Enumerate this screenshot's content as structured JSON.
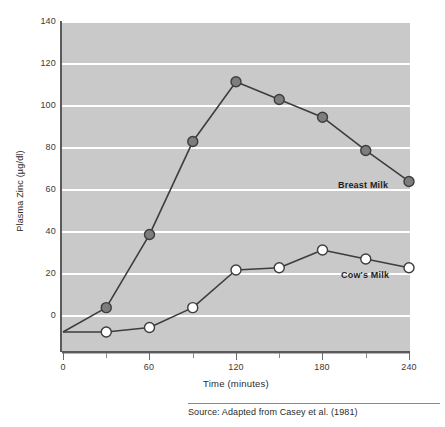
{
  "chart_data": {
    "type": "line",
    "title": "",
    "xlabel": "Time (minutes)",
    "ylabel": "Plasma Zinc (µg/dl)",
    "xlim": [
      0,
      240
    ],
    "ylim": [
      -10,
      140
    ],
    "xticks": [
      0,
      60,
      120,
      180,
      240
    ],
    "xticklabels": [
      "0",
      "60",
      "120",
      "180",
      "240"
    ],
    "xminor_ticks": [
      30,
      90,
      150,
      210
    ],
    "yticks": [
      0,
      20,
      40,
      60,
      80,
      100,
      120,
      140
    ],
    "yticklabels": [
      "0",
      "20",
      "40",
      "60",
      "80",
      "100",
      "120",
      "140"
    ],
    "grid": "horizontal-white",
    "legend_position": "inline-right",
    "x": [
      0,
      30,
      60,
      90,
      120,
      150,
      180,
      210,
      240
    ],
    "series": [
      {
        "name": "Breast Milk",
        "values": [
          0,
          11,
          44,
          86,
          113,
          105,
          97,
          82,
          68
        ],
        "marker": "filled-circle",
        "marker_fill": "#7d7d7d",
        "line_color": "#3d3d3d",
        "label_x": 240,
        "label_y": 68
      },
      {
        "name": "Cow's Milk",
        "values": [
          0,
          0,
          2,
          11,
          28,
          29,
          37,
          33,
          29
        ],
        "marker": "open-circle",
        "marker_fill": "#ffffff",
        "line_color": "#3d3d3d",
        "label_x": 240,
        "label_y": 29
      }
    ],
    "annotations": [
      {
        "name": "breast-milk-inline-label",
        "text": "Breast Milk"
      },
      {
        "name": "cows-milk-inline-label",
        "text": "Cow's Milk"
      }
    ]
  },
  "figure": {
    "plot_background": "#c9c9c9",
    "page_background": "#ffffff",
    "gridline_color": "#ffffff",
    "axis_color": "#5a5a5a"
  },
  "source": {
    "text": "Source: Adapted from Casey et al. (1981)"
  }
}
